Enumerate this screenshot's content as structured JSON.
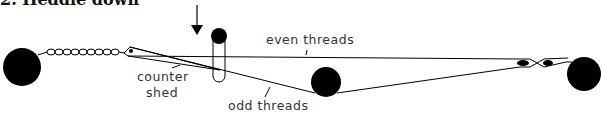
{
  "title": "2. Heddle down",
  "labels": {
    "even_threads": "even threads",
    "counter_shed": [
      "counter",
      "shed"
    ],
    "odd_threads": "odd threads"
  },
  "elements": {
    "left_roll": "warp-beam",
    "chain": "chained-warp",
    "heddle_rod": "heddle-rod",
    "arrow": "down-arrow",
    "middle_roll": "shed-roll",
    "lease_sticks": "lease-sticks",
    "right_roll": "cloth-beam"
  },
  "colors": {
    "ink": "#000000",
    "text": "#333333",
    "background": "#ffffff"
  }
}
